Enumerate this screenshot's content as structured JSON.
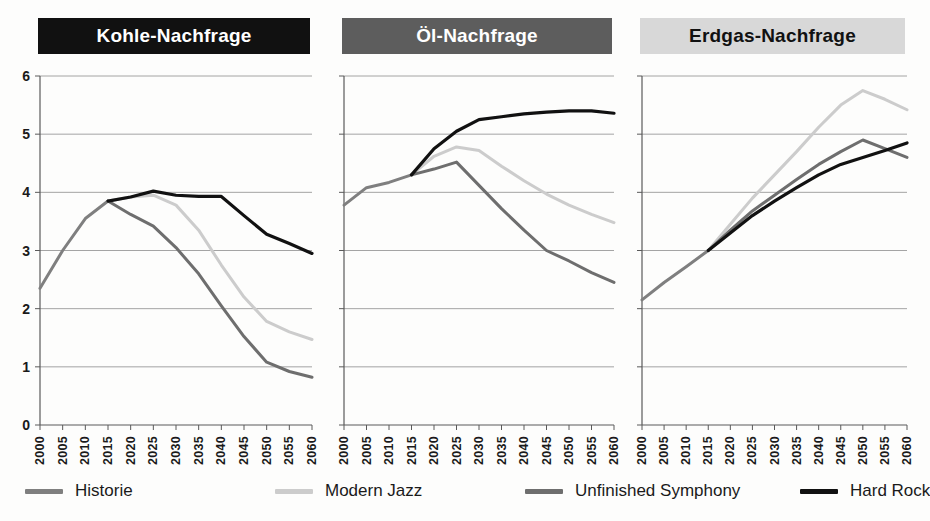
{
  "chart_data": [
    {
      "type": "line",
      "title": "Kohle-Nachfrage",
      "title_bg": "#111111",
      "title_fg": "#ffffff",
      "xlabel": "",
      "ylabel": "",
      "ylim": [
        0,
        6
      ],
      "yticks": [
        0,
        1,
        2,
        3,
        4,
        5,
        6
      ],
      "grid": true,
      "x": [
        2000,
        2005,
        2010,
        2015,
        2020,
        2025,
        2030,
        2035,
        2040,
        2045,
        2050,
        2055,
        2060
      ],
      "series": [
        {
          "name": "Historie",
          "color": "#7f7f7f",
          "values": [
            2.35,
            3.0,
            3.55,
            3.85,
            null,
            null,
            null,
            null,
            null,
            null,
            null,
            null,
            null
          ]
        },
        {
          "name": "Modern Jazz",
          "color": "#cccccc",
          "values": [
            null,
            null,
            null,
            3.85,
            3.92,
            3.95,
            3.78,
            3.35,
            2.75,
            2.2,
            1.78,
            1.6,
            1.47
          ]
        },
        {
          "name": "Unfinished Symphony",
          "color": "#6e6e6e",
          "values": [
            null,
            null,
            null,
            3.85,
            3.62,
            3.42,
            3.05,
            2.6,
            2.05,
            1.52,
            1.08,
            0.92,
            0.82
          ]
        },
        {
          "name": "Hard Rock",
          "color": "#111111",
          "values": [
            null,
            null,
            null,
            3.85,
            3.92,
            4.02,
            3.95,
            3.93,
            3.93,
            3.6,
            3.28,
            3.12,
            2.95
          ]
        }
      ]
    },
    {
      "type": "line",
      "title": "Öl-Nachfrage",
      "title_bg": "#5d5d5d",
      "title_fg": "#ffffff",
      "xlabel": "",
      "ylabel": "",
      "ylim": [
        0,
        6
      ],
      "yticks": [
        0,
        1,
        2,
        3,
        4,
        5,
        6
      ],
      "grid": true,
      "x": [
        2000,
        2005,
        2010,
        2015,
        2020,
        2025,
        2030,
        2035,
        2040,
        2045,
        2050,
        2055,
        2060
      ],
      "series": [
        {
          "name": "Historie",
          "color": "#7f7f7f",
          "values": [
            3.78,
            4.08,
            4.17,
            4.3,
            null,
            null,
            null,
            null,
            null,
            null,
            null,
            null,
            null
          ]
        },
        {
          "name": "Modern Jazz",
          "color": "#cccccc",
          "values": [
            null,
            null,
            null,
            4.3,
            4.62,
            4.78,
            4.72,
            4.45,
            4.2,
            3.97,
            3.78,
            3.62,
            3.48
          ]
        },
        {
          "name": "Unfinished Symphony",
          "color": "#6e6e6e",
          "values": [
            null,
            null,
            null,
            4.3,
            4.4,
            4.52,
            4.12,
            3.72,
            3.35,
            3.0,
            2.82,
            2.62,
            2.45
          ]
        },
        {
          "name": "Hard Rock",
          "color": "#111111",
          "values": [
            null,
            null,
            null,
            4.3,
            4.75,
            5.05,
            5.25,
            5.3,
            5.35,
            5.38,
            5.4,
            5.4,
            5.36
          ]
        }
      ]
    },
    {
      "type": "line",
      "title": "Erdgas-Nachfrage",
      "title_bg": "#d8d8d8",
      "title_fg": "#111111",
      "xlabel": "",
      "ylabel": "",
      "ylim": [
        0,
        6
      ],
      "yticks": [
        0,
        1,
        2,
        3,
        4,
        5,
        6
      ],
      "grid": true,
      "x": [
        2000,
        2005,
        2010,
        2015,
        2020,
        2025,
        2030,
        2035,
        2040,
        2045,
        2050,
        2055,
        2060
      ],
      "series": [
        {
          "name": "Historie",
          "color": "#7f7f7f",
          "values": [
            2.15,
            2.45,
            2.72,
            3.0,
            null,
            null,
            null,
            null,
            null,
            null,
            null,
            null,
            null
          ]
        },
        {
          "name": "Modern Jazz",
          "color": "#cccccc",
          "values": [
            null,
            null,
            null,
            3.0,
            3.45,
            3.9,
            4.3,
            4.7,
            5.12,
            5.5,
            5.75,
            5.6,
            5.42
          ]
        },
        {
          "name": "Unfinished Symphony",
          "color": "#6e6e6e",
          "values": [
            null,
            null,
            null,
            3.0,
            3.35,
            3.68,
            3.95,
            4.22,
            4.48,
            4.7,
            4.9,
            4.75,
            4.6
          ]
        },
        {
          "name": "Hard Rock",
          "color": "#111111",
          "values": [
            null,
            null,
            null,
            3.0,
            3.3,
            3.6,
            3.85,
            4.08,
            4.3,
            4.48,
            4.6,
            4.72,
            4.85
          ]
        }
      ]
    }
  ],
  "yticks_labels": [
    "6",
    "5",
    "4",
    "3",
    "2",
    "1",
    "0"
  ],
  "xticks_labels": [
    "2000",
    "2005",
    "2010",
    "2015",
    "2020",
    "2025",
    "2030",
    "2035",
    "2040",
    "2045",
    "2050",
    "2055",
    "2060"
  ],
  "legend": {
    "position": "bottom",
    "items": [
      {
        "label": "Historie",
        "color": "#7f7f7f"
      },
      {
        "label": "Modern Jazz",
        "color": "#cccccc"
      },
      {
        "label": "Unfinished Symphony",
        "color": "#6e6e6e"
      },
      {
        "label": "Hard Rock",
        "color": "#111111"
      }
    ]
  },
  "style": {
    "grid_color": "#9a9a9a",
    "axis_color": "#5a5a5a",
    "background": "#fdfdfc"
  }
}
